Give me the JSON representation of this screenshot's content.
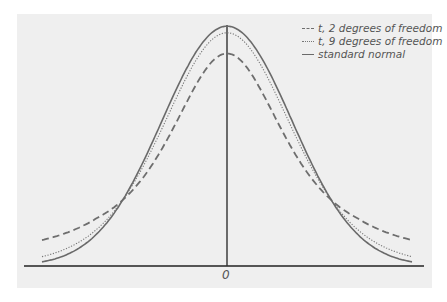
{
  "chart_data": {
    "type": "line",
    "title": "",
    "xlabel": "",
    "ylabel": "",
    "x_tick_labels": [
      "0"
    ],
    "xlim": [
      -2.85,
      2.85
    ],
    "grid": false,
    "legend_position": "upper right",
    "series": [
      {
        "name": "t, 2 degrees of freedom",
        "dist": "t",
        "df": 2,
        "style": "dashed",
        "color": "#707070",
        "peak": 0.354
      },
      {
        "name": "t, 9 degrees of freedom",
        "dist": "t",
        "df": 9,
        "style": "dotted",
        "color": "#707070",
        "peak": 0.388
      },
      {
        "name": "standard normal",
        "dist": "normal",
        "style": "solid",
        "color": "#707070",
        "peak": 0.399
      }
    ]
  },
  "legend": {
    "items": [
      {
        "label": "t, 2 degrees of freedom"
      },
      {
        "label": "t, 9 degrees of freedom"
      },
      {
        "label": "standard normal"
      }
    ]
  },
  "axis": {
    "zero_label": "0"
  }
}
